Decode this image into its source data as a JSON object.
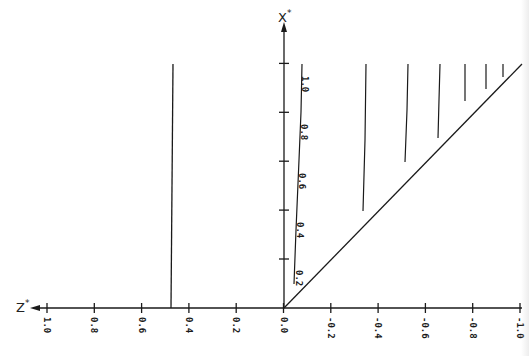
{
  "chart_data": {
    "type": "line",
    "title": "",
    "xlabel": "Z*",
    "ylabel": "X*",
    "xlim": [
      1.0,
      -1.0
    ],
    "ylim": [
      0.0,
      1.0
    ],
    "x_ticks": [
      "1.0",
      "0.8",
      "0.6",
      "0.4",
      "0.2",
      "0.0",
      "-0.2",
      "-0.4",
      "-0.6",
      "-0.8",
      "-1.0"
    ],
    "y_ticks": [
      "0.2",
      "0.4",
      "0.6",
      "0.8",
      "1.0"
    ],
    "grid": false,
    "legend": null,
    "series": [
      {
        "name": "boundary X* = -Z*",
        "points": [
          [
            0.0,
            0.0
          ],
          [
            -1.0,
            1.0
          ]
        ]
      },
      {
        "name": "vertical line Z* ≈ 0.48",
        "points": [
          [
            0.48,
            0.0
          ],
          [
            0.48,
            1.0
          ]
        ]
      },
      {
        "name": "labeled curve near X* axis",
        "points": [
          [
            -0.04,
            0.1
          ],
          [
            -0.055,
            0.4
          ],
          [
            -0.075,
            1.0
          ]
        ],
        "annotations": [
          "0.2",
          "0.4",
          "0.6",
          "0.8",
          "1.0"
        ]
      },
      {
        "name": "curve 1",
        "points": [
          [
            -0.35,
            0.4
          ],
          [
            -0.37,
            1.0
          ]
        ]
      },
      {
        "name": "curve 2",
        "points": [
          [
            -0.52,
            0.6
          ],
          [
            -0.53,
            1.0
          ]
        ]
      },
      {
        "name": "curve 3",
        "points": [
          [
            -0.66,
            0.7
          ],
          [
            -0.66,
            1.0
          ]
        ]
      },
      {
        "name": "curve 4",
        "points": [
          [
            -0.77,
            0.85
          ],
          [
            -0.77,
            1.0
          ]
        ]
      },
      {
        "name": "curve 5",
        "points": [
          [
            -0.86,
            0.9
          ],
          [
            -0.86,
            1.0
          ]
        ]
      },
      {
        "name": "curve 6",
        "points": [
          [
            -0.93,
            0.95
          ],
          [
            -0.93,
            1.0
          ]
        ]
      }
    ]
  },
  "labels": {
    "x_axis": "Z",
    "y_axis": "X",
    "star": "*"
  },
  "colors": {
    "ink": "#1a1a1a",
    "background": "#ffffff"
  }
}
